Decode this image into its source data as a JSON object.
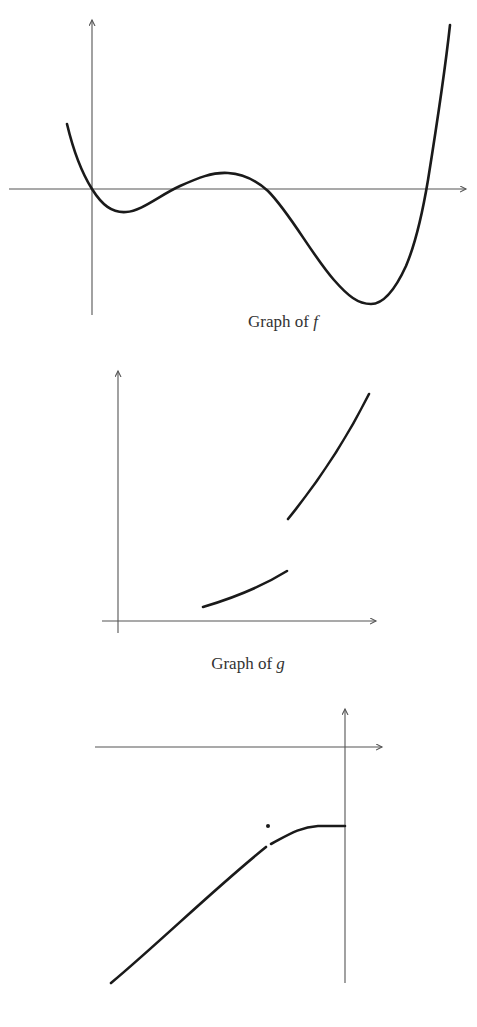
{
  "figures": [
    {
      "id": "f",
      "caption_prefix": "Graph of ",
      "caption_function": "f",
      "description": "Quartic-like curve: starts above x-axis at left, passes through origin, dips to a shallow local minimum, rises to a small local maximum above the axis, falls to a deep minimum, then rises steeply crossing the x-axis."
    },
    {
      "id": "g",
      "caption_prefix": "Graph of ",
      "caption_function": "g",
      "description": "Increasing function with a jump discontinuity: a lower increasing segment, then a jump up to an upper increasing (concave up) segment."
    },
    {
      "id": "h",
      "caption_prefix": "",
      "caption_function": "",
      "description": "Increasing curve entirely below the x-axis in the second quadrant, with a removable discontinuity (hole) and an isolated point plotted above the hole; curve levels off to a horizontal segment meeting the y-axis."
    }
  ],
  "colors": {
    "background": "#ffffff",
    "curve": "#1a1a1a",
    "axis": "#555555",
    "caption": "#333333"
  }
}
